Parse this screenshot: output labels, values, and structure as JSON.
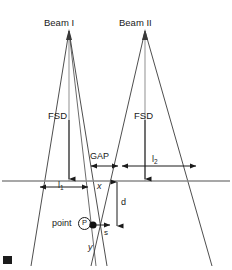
{
  "figure": {
    "background_color": "#ffffff",
    "line_color": "#3a3a3a",
    "text_color": "#1a1a1a"
  },
  "labels": {
    "beam1": "Beam I",
    "beam2": "Beam II",
    "fsd1": "FSD",
    "fsd2": "FSD",
    "gap": "GAP",
    "l1": "l",
    "l1_sub": "1",
    "l2": "l",
    "l2_sub": "2",
    "x": "x",
    "y": "y",
    "d": "d",
    "s": "s",
    "point": "point",
    "point_symbol": "P"
  },
  "geometry": {
    "beam1_apex": {
      "x": 69,
      "y": 30
    },
    "beam2_apex": {
      "x": 145,
      "y": 30
    },
    "field_line_y": 181,
    "gap_line_y": 166,
    "point_p": {
      "x": 92,
      "y": 225
    },
    "beam1_left_edge_bottom": {
      "x": 34,
      "y": 265
    },
    "beam1_right_edge_bottom": {
      "x": 104,
      "y": 265
    },
    "beam2_left_edge_bottom": {
      "x": 110,
      "y": 265
    },
    "beam2_right_edge_bottom": {
      "x": 212,
      "y": 265
    }
  },
  "measurements": {
    "l1_span": {
      "from_x": 40,
      "to_x": 88,
      "y": 181
    },
    "gap_span": {
      "from_x": 90,
      "to_x": 120,
      "y": 166
    },
    "l2_span": {
      "from_x": 122,
      "to_x": 196,
      "y": 166
    },
    "d_span": {
      "from_y": 181,
      "to_y": 228,
      "x": 119
    }
  }
}
